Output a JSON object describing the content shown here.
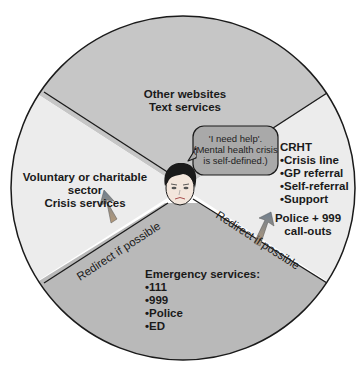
{
  "diagram": {
    "segments": {
      "top": {
        "lines": [
          "Other websites",
          "Text services"
        ],
        "color": "#c6c6c6"
      },
      "left": {
        "lines": [
          "Voluntary or charitable",
          "sector",
          "Crisis services"
        ],
        "color": "#ececec"
      },
      "right": {
        "title": "CRHT",
        "items": [
          "Crisis line",
          "GP referral",
          "Self-referral",
          "Support"
        ],
        "extra": [
          "Police + 999",
          "call-outs"
        ],
        "color": "#ececec"
      },
      "bottom": {
        "title": "Emergency services:",
        "items": [
          "111",
          "999",
          "Police",
          "ED"
        ],
        "color": "#b9b9b9"
      }
    },
    "speech_bubble": {
      "lines": [
        "'I need help'.",
        "(Mental health crisis",
        "is self-defined.)"
      ],
      "color": "#a9a9a9"
    },
    "redirect_left": "Redirect if possible",
    "redirect_right": "Redirect if possible",
    "arrow_color": "#7a7a7a",
    "outline_color": "#1a1a1a"
  }
}
